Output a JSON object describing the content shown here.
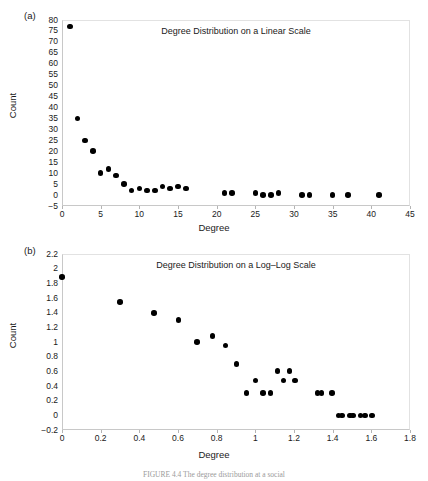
{
  "figure": {
    "caption": "FIGURE 4.4  The degree distribution at a social"
  },
  "panels": [
    {
      "letter": "(a)",
      "ylabel": "Count",
      "xlabel": "Degree"
    },
    {
      "letter": "(b)",
      "ylabel": "Count",
      "xlabel": "Degree"
    }
  ],
  "chart_data": [
    {
      "type": "scatter",
      "title": "Degree Distribution on a Linear Scale",
      "xlabel": "Degree",
      "ylabel": "Count",
      "xlim": [
        0,
        45
      ],
      "ylim": [
        -5,
        80
      ],
      "xticks": [
        0,
        5,
        10,
        15,
        20,
        25,
        30,
        35,
        40,
        45
      ],
      "xtick_labels": [
        "0",
        "5",
        "10",
        "15",
        "20",
        "25",
        "30",
        "35",
        "40",
        "45"
      ],
      "yticks": [
        -5,
        0,
        5,
        10,
        15,
        20,
        25,
        30,
        35,
        40,
        45,
        50,
        55,
        60,
        65,
        70,
        75,
        80
      ],
      "ytick_labels": [
        "−5",
        "0",
        "5",
        "10",
        "15",
        "20",
        "25",
        "30",
        "35",
        "40",
        "45",
        "50",
        "55",
        "60",
        "65",
        "70",
        "75",
        "80"
      ],
      "grid": false,
      "legend": "none",
      "marker_color": "#000000",
      "x": [
        1,
        2,
        3,
        4,
        5,
        6,
        7,
        8,
        9,
        10,
        11,
        12,
        13,
        14,
        15,
        16,
        21,
        22,
        25,
        26,
        27,
        28,
        31,
        32,
        35,
        37,
        41
      ],
      "y": [
        77,
        35,
        25,
        20,
        10,
        12,
        9,
        5,
        2,
        3,
        2,
        2,
        4,
        3,
        4,
        3,
        1,
        1,
        1,
        0,
        0,
        1,
        0,
        0,
        0,
        0,
        0
      ]
    },
    {
      "type": "scatter",
      "title": "Degree Distribution on a Log–Log Scale",
      "xlabel": "Degree",
      "ylabel": "Count",
      "xlim": [
        0,
        1.8
      ],
      "ylim": [
        -0.2,
        2.2
      ],
      "xticks": [
        0,
        0.2,
        0.4,
        0.6,
        0.8,
        1.0,
        1.2,
        1.4,
        1.6,
        1.8
      ],
      "xtick_labels": [
        "0",
        "0.2",
        "0.4",
        "0.6",
        "0.8",
        "1",
        "1.2",
        "1.4",
        "1.6",
        "1.8"
      ],
      "yticks": [
        -0.2,
        0,
        0.2,
        0.4,
        0.6,
        0.8,
        1.0,
        1.2,
        1.4,
        1.6,
        1.8,
        2.0,
        2.2
      ],
      "ytick_labels": [
        "−0.2",
        "0",
        "0.2",
        "0.4",
        "0.6",
        "0.8",
        "1",
        "1.2",
        "1.4",
        "1.6",
        "1.8",
        "2",
        "2.2"
      ],
      "grid": false,
      "legend": "none",
      "marker_color": "#000000",
      "x": [
        0.0,
        0.301,
        0.477,
        0.602,
        0.699,
        0.778,
        0.845,
        0.903,
        0.954,
        1.0,
        1.041,
        1.079,
        1.114,
        1.146,
        1.176,
        1.204,
        1.322,
        1.342,
        1.398,
        1.431,
        1.447,
        1.491,
        1.505,
        1.544,
        1.568,
        1.602
      ],
      "y": [
        1.886,
        1.544,
        1.398,
        1.301,
        1.0,
        1.079,
        0.954,
        0.699,
        0.301,
        0.477,
        0.301,
        0.301,
        0.602,
        0.477,
        0.602,
        0.477,
        0.301,
        0.301,
        0.301,
        0.0,
        0.0,
        0.0,
        0.0,
        0.0,
        0.0,
        0.0
      ]
    }
  ]
}
